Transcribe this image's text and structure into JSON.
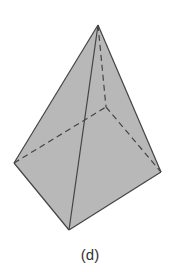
{
  "figure": {
    "caption": "(d)",
    "shape": "tetrahedron",
    "colors": {
      "fill": "#b8b8b8",
      "edge": "#444444",
      "background": "#ffffff"
    },
    "vertices": {
      "apex": [
        98,
        25
      ],
      "left": [
        14,
        163
      ],
      "bottom": [
        69,
        230
      ],
      "right": [
        161,
        172
      ],
      "hidden": [
        106,
        107
      ]
    },
    "visible_edges": [
      [
        "apex",
        "left"
      ],
      [
        "apex",
        "bottom"
      ],
      [
        "apex",
        "right"
      ],
      [
        "left",
        "bottom"
      ],
      [
        "bottom",
        "right"
      ]
    ],
    "hidden_edges": [
      [
        "apex",
        "hidden"
      ],
      [
        "left",
        "hidden"
      ],
      [
        "hidden",
        "right"
      ]
    ]
  }
}
